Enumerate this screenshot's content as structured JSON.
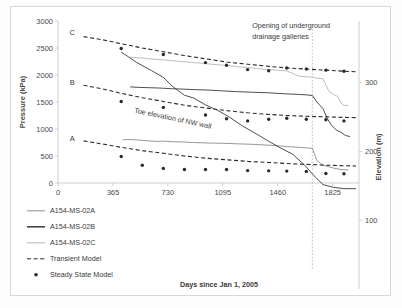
{
  "chart_data": {
    "type": "line",
    "title": "",
    "xlabel": "Days since Jan 1, 2005",
    "ylabel": "Pressure (kPa)",
    "y2label": "Elevation (m)",
    "xlim": [
      0,
      2000
    ],
    "ylim": [
      0,
      3000
    ],
    "y2lim": [
      0,
      390
    ],
    "xticks": [
      "0",
      "365",
      "730",
      "1095",
      "1460",
      "1825"
    ],
    "xtick_values": [
      0,
      365,
      730,
      1095,
      1460,
      1825
    ],
    "yticks": [
      "0",
      "500",
      "1000",
      "1500",
      "2000",
      "2500",
      "3000"
    ],
    "ytick_values": [
      0,
      500,
      1000,
      1500,
      2000,
      2500,
      3000
    ],
    "y2ticks": [
      "100",
      "200",
      "300"
    ],
    "y2tick_values": [
      100,
      200,
      300
    ],
    "grid": false,
    "legend_position": "bottom-left",
    "legend": [
      {
        "label": "A154-MS-02A",
        "marker": "solid-line",
        "color": "#8c8c8c"
      },
      {
        "label": "A154-MS-02B",
        "marker": "solid-line",
        "color": "#3a3a3a"
      },
      {
        "label": "A154-MS-02C",
        "marker": "solid-line",
        "color": "#b5b5b5"
      },
      {
        "label": "Transient Model",
        "marker": "dashed-line",
        "color": "#2a2a2a"
      },
      {
        "label": "Steady State Model",
        "marker": "dot",
        "color": "#2a2a2a"
      }
    ],
    "annotations": [
      {
        "text": "Opening of underground",
        "x": 1290,
        "y": 2870
      },
      {
        "text": "drainage galleries",
        "x": 1290,
        "y": 2670
      },
      {
        "text": "Toe elevation of NW wall",
        "x": 760,
        "y": 245,
        "axis": "y2",
        "rotated": true
      },
      {
        "text": "C",
        "x": 95,
        "y": 2740
      },
      {
        "text": "B",
        "x": 95,
        "y": 1820
      },
      {
        "text": "A",
        "x": 95,
        "y": 770
      }
    ],
    "vline": {
      "x": 1690,
      "style": "dotted",
      "color": "#b0b0b0"
    },
    "series": [
      {
        "name": "A154-MS-02C",
        "kind": "measured",
        "color": "#b5b5b5",
        "x": [
          480,
          520,
          560,
          600,
          700,
          760,
          800,
          900,
          1000,
          1100,
          1180,
          1200,
          1260,
          1320,
          1400,
          1460,
          1520,
          1600,
          1660,
          1690,
          1700,
          1720,
          1760,
          1800,
          1830,
          1860,
          1880,
          1900,
          1930
        ],
        "y": [
          2330,
          2320,
          2315,
          2300,
          2280,
          2265,
          2255,
          2230,
          2205,
          2180,
          2160,
          2150,
          2140,
          2120,
          2100,
          2090,
          2075,
          1980,
          1965,
          1960,
          1955,
          1940,
          1930,
          1700,
          1640,
          1600,
          1480,
          1440,
          1430
        ]
      },
      {
        "name": "A154-MS-02B",
        "kind": "measured",
        "color": "#3a3a3a",
        "x": [
          480,
          540,
          600,
          660,
          700,
          760,
          820,
          900,
          1000,
          1100,
          1200,
          1300,
          1400,
          1460,
          1520,
          1600,
          1660,
          1690,
          1720,
          1760,
          1790,
          1820,
          1850,
          1880,
          1910,
          1940
        ],
        "y": [
          1780,
          1770,
          1765,
          1760,
          1755,
          1745,
          1740,
          1730,
          1720,
          1705,
          1690,
          1680,
          1670,
          1660,
          1650,
          1640,
          1630,
          1620,
          1500,
          1380,
          1190,
          1060,
          980,
          940,
          880,
          860
        ]
      },
      {
        "name": "A154-MS-02A",
        "kind": "measured",
        "color": "#8c8c8c",
        "x": [
          430,
          470,
          520,
          560,
          600,
          660,
          700,
          760,
          820,
          900,
          1000,
          1100,
          1200,
          1300,
          1400,
          1460,
          1520,
          1600,
          1660,
          1690,
          1720,
          1760,
          1800,
          1840,
          1880,
          1930
        ],
        "y": [
          800,
          805,
          800,
          790,
          780,
          770,
          775,
          765,
          760,
          750,
          740,
          735,
          725,
          715,
          700,
          690,
          675,
          660,
          650,
          640,
          420,
          330,
          300,
          270,
          250,
          240
        ]
      },
      {
        "name": "Transient Model C",
        "kind": "transient",
        "color": "#2a2a2a",
        "x": [
          170,
          300,
          420,
          560,
          700,
          840,
          980,
          1120,
          1260,
          1400,
          1520,
          1650,
          1780,
          1900,
          1980
        ],
        "y": [
          2710,
          2650,
          2580,
          2500,
          2430,
          2360,
          2300,
          2240,
          2200,
          2160,
          2130,
          2110,
          2090,
          2070,
          2060
        ]
      },
      {
        "name": "Transient Model B",
        "kind": "transient",
        "color": "#2a2a2a",
        "x": [
          170,
          300,
          420,
          560,
          700,
          840,
          980,
          1120,
          1260,
          1400,
          1520,
          1650,
          1780,
          1900,
          1980
        ],
        "y": [
          1810,
          1740,
          1660,
          1580,
          1510,
          1440,
          1390,
          1340,
          1300,
          1270,
          1250,
          1235,
          1225,
          1215,
          1210
        ]
      },
      {
        "name": "Transient Model A",
        "kind": "transient",
        "color": "#2a2a2a",
        "x": [
          170,
          300,
          420,
          560,
          700,
          840,
          980,
          1120,
          1260,
          1400,
          1520,
          1650,
          1780,
          1900,
          1980
        ],
        "y": [
          780,
          720,
          660,
          600,
          550,
          500,
          460,
          430,
          400,
          380,
          360,
          345,
          330,
          320,
          315
        ]
      },
      {
        "name": "Steady State Model C",
        "kind": "steady",
        "color": "#2a2a2a",
        "x": [
          420,
          700,
          980,
          1120,
          1260,
          1400,
          1520,
          1650,
          1780,
          1900
        ],
        "y": [
          2490,
          2380,
          2230,
          2180,
          2100,
          2080,
          2130,
          2110,
          2090,
          2070
        ]
      },
      {
        "name": "Steady State Model B",
        "kind": "steady",
        "color": "#2a2a2a",
        "x": [
          420,
          700,
          980,
          1120,
          1260,
          1400,
          1520,
          1650,
          1780,
          1900
        ],
        "y": [
          1510,
          1400,
          1260,
          1190,
          1150,
          1180,
          1200,
          1180,
          1170,
          1150
        ]
      },
      {
        "name": "Steady State Model A",
        "kind": "steady",
        "color": "#2a2a2a",
        "x": [
          420,
          560,
          700,
          840,
          980,
          1120,
          1260,
          1400,
          1520,
          1650,
          1780,
          1900
        ],
        "y": [
          490,
          330,
          270,
          250,
          250,
          250,
          230,
          225,
          220,
          215,
          175,
          170
        ]
      },
      {
        "name": "Toe elevation of NW wall",
        "kind": "toe",
        "color": "#3a3a3a",
        "axis": "y2",
        "x": [
          420,
          520,
          620,
          700,
          760,
          840,
          900,
          980,
          1060,
          1140,
          1220,
          1300,
          1400,
          1480,
          1560,
          1640,
          1700,
          1760,
          1830,
          1900,
          1980
        ],
        "y": [
          345,
          330,
          318,
          308,
          295,
          282,
          278,
          268,
          260,
          250,
          238,
          228,
          215,
          205,
          196,
          180,
          165,
          152,
          148,
          146,
          146
        ]
      }
    ]
  }
}
